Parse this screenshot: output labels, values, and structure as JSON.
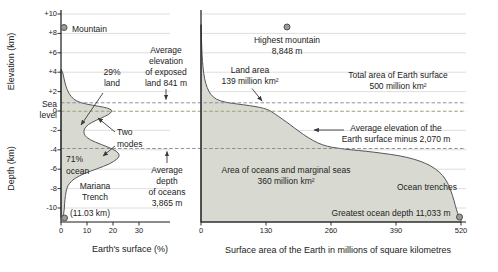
{
  "figure": {
    "left_panel": {
      "elevation_axis_label": "Elevation (km)",
      "depth_axis_label": "Depth (km)",
      "sea_level_label": [
        "Sea",
        "level"
      ],
      "y_ticks": [
        "+10",
        "+8",
        "+6",
        "+4",
        "+2",
        "0",
        "-2",
        "-4",
        "-6",
        "-8",
        "-10"
      ],
      "x_ticks": [
        "0",
        "10",
        "20",
        "30"
      ],
      "x_axis_label": "Earth's surface (%)",
      "mountain_label": "Mountain",
      "land_percent": [
        "29%",
        "land"
      ],
      "two_modes": [
        "Two",
        "modes"
      ],
      "ocean_percent": [
        "71%",
        "ocean"
      ],
      "mariana_trench": [
        "Mariana",
        "Trench",
        "(11.03 km)"
      ]
    },
    "gap_annotations": {
      "avg_elevation_exposed_land": [
        "Average",
        "elevation",
        "of exposed",
        "land 841 m"
      ],
      "avg_depth_oceans": [
        "Average",
        "depth",
        "of oceans",
        "3,865 m"
      ]
    },
    "right_panel": {
      "x_ticks": [
        "0",
        "130",
        "260",
        "390",
        "520"
      ],
      "x_axis_label": "Surface area of the Earth in millions of square kilometres",
      "highest_mountain": [
        "Highest mountain",
        "8,848 m"
      ],
      "land_area": [
        "Land area",
        "139 million km²"
      ],
      "total_area": [
        "Total area of Earth surface",
        "500 million km²"
      ],
      "avg_elevation_surface": [
        "Average elevation of the",
        "Earth surface minus 2,070 m"
      ],
      "ocean_area": [
        "Area of oceans and marginal seas",
        "360 million km²"
      ],
      "ocean_trenches": "Ocean trenches",
      "greatest_depth": "Greatest ocean depth 11,033 m"
    },
    "colors": {
      "curve_fill": "#d8dad2",
      "curve_stroke": "#55565a",
      "sea_level_dash": "#9aa071",
      "reference_dash": "#85858a",
      "gridline": "#d8d6d2",
      "marker_fill": "#9b9b9b",
      "marker_stroke": "#4f4f4f",
      "text": "#222222"
    }
  },
  "chart_data": [
    {
      "type": "area",
      "title": "Hypsometric frequency curve of Earth's surface",
      "xlabel": "Earth's surface (%)",
      "ylabel": "Elevation / Depth (km)",
      "xlim": [
        0,
        35
      ],
      "ylim": [
        -11,
        10
      ],
      "x_ticks": [
        0,
        10,
        20,
        30
      ],
      "y_ticks": [
        10,
        8,
        6,
        4,
        2,
        0,
        -2,
        -4,
        -6,
        -8,
        -10
      ],
      "grid": true,
      "point_format": "[elevation_km, percent_of_surface]",
      "points": [
        [
          4.3,
          0
        ],
        [
          4.0,
          0.7
        ],
        [
          3.4,
          1.1
        ],
        [
          2.6,
          1.8
        ],
        [
          1.8,
          3.0
        ],
        [
          1.2,
          4.8
        ],
        [
          0.85,
          7.5
        ],
        [
          0.6,
          12
        ],
        [
          0.4,
          16.5
        ],
        [
          0.15,
          19.6
        ],
        [
          -0.2,
          19.3
        ],
        [
          -0.55,
          17
        ],
        [
          -0.95,
          13.5
        ],
        [
          -1.4,
          10.3
        ],
        [
          -1.85,
          8.9
        ],
        [
          -2.3,
          8.7
        ],
        [
          -2.75,
          9.8
        ],
        [
          -3.2,
          13
        ],
        [
          -3.7,
          18
        ],
        [
          -4.15,
          21.5
        ],
        [
          -4.55,
          22.6
        ],
        [
          -4.95,
          21.7
        ],
        [
          -5.45,
          18.8
        ],
        [
          -5.95,
          14
        ],
        [
          -6.45,
          8.8
        ],
        [
          -6.95,
          5.2
        ],
        [
          -7.45,
          3.2
        ],
        [
          -7.95,
          2.2
        ],
        [
          -8.7,
          1.7
        ],
        [
          -9.5,
          1.4
        ],
        [
          -10.3,
          1.2
        ],
        [
          -10.8,
          0.9
        ],
        [
          -11.0,
          0
        ]
      ],
      "annotations": [
        "29% land",
        "71% ocean",
        "Two modes",
        "Average elevation of exposed land 841 m",
        "Average depth of oceans 3,865 m",
        "Mountain",
        "Mariana Trench (11.03 km)"
      ]
    },
    {
      "type": "area",
      "title": "Hypsographic (cumulative) curve of Earth's surface",
      "xlabel": "Surface area of the Earth in millions of square kilometres",
      "ylabel": "Elevation / Depth (km)",
      "xlim": [
        0,
        530
      ],
      "ylim": [
        -11,
        10
      ],
      "x_ticks": [
        0,
        130,
        260,
        390,
        520
      ],
      "y_ticks": [
        10,
        8,
        6,
        4,
        2,
        0,
        -2,
        -4,
        -6,
        -8,
        -10
      ],
      "grid": true,
      "point_format": "[cumulative_area_million_km2, elevation_km]",
      "points": [
        [
          0,
          8.9
        ],
        [
          1,
          7.2
        ],
        [
          2,
          5.8
        ],
        [
          4,
          4.4
        ],
        [
          7,
          3.3
        ],
        [
          12,
          2.4
        ],
        [
          19,
          1.7
        ],
        [
          30,
          1.2
        ],
        [
          48,
          0.9
        ],
        [
          72,
          0.72
        ],
        [
          98,
          0.55
        ],
        [
          118,
          0.38
        ],
        [
          132,
          0.18
        ],
        [
          139,
          0
        ],
        [
          149,
          -0.35
        ],
        [
          162,
          -0.8
        ],
        [
          178,
          -1.4
        ],
        [
          196,
          -2.1
        ],
        [
          214,
          -2.75
        ],
        [
          233,
          -3.3
        ],
        [
          252,
          -3.65
        ],
        [
          275,
          -3.85
        ],
        [
          300,
          -4.0
        ],
        [
          330,
          -4.15
        ],
        [
          362,
          -4.35
        ],
        [
          396,
          -4.6
        ],
        [
          426,
          -4.95
        ],
        [
          450,
          -5.4
        ],
        [
          469,
          -5.95
        ],
        [
          484,
          -6.65
        ],
        [
          495,
          -7.55
        ],
        [
          503,
          -8.7
        ],
        [
          509,
          -9.8
        ],
        [
          513,
          -10.55
        ],
        [
          517,
          -10.95
        ],
        [
          520,
          -11.05
        ]
      ],
      "annotations": [
        "Highest mountain 8,848 m",
        "Land area 139 million km²",
        "Total area of Earth surface 500 million km²",
        "Average elevation of the Earth surface minus 2,070 m",
        "Area of oceans and marginal seas 360 million km²",
        "Ocean trenches",
        "Greatest ocean depth 11,033 m"
      ]
    }
  ]
}
